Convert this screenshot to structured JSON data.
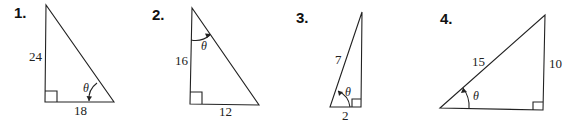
{
  "problems": [
    {
      "number": "1.",
      "sides": {
        "vertical": "24",
        "horizontal": "18"
      },
      "angle": "θ",
      "angle_position": "bottom-right"
    },
    {
      "number": "2.",
      "sides": {
        "vertical": "16",
        "horizontal": "12"
      },
      "angle": "θ",
      "angle_position": "top"
    },
    {
      "number": "3.",
      "sides": {
        "hypotenuse": "7",
        "horizontal": "2"
      },
      "angle": "θ",
      "angle_position": "bottom-left"
    },
    {
      "number": "4.",
      "sides": {
        "hypotenuse": "15",
        "vertical": "10"
      },
      "angle": "θ",
      "angle_position": "left"
    }
  ],
  "colors": {
    "stroke": "#222222",
    "background": "#ffffff"
  }
}
